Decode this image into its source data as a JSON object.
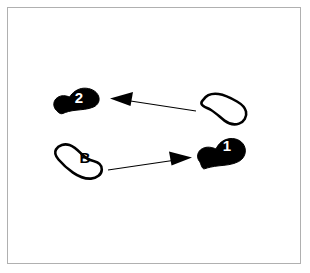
{
  "diagram": {
    "background_color": "#ffffff",
    "frame_color": "#b0b0b0",
    "ink_color": "#000000",
    "footprints": [
      {
        "id": "footprint-2",
        "label": "2",
        "fill": "filled",
        "fill_color": "#000000",
        "label_color": "#ffffff",
        "position": "upper-left",
        "orientation": "pointing-upper-right"
      },
      {
        "id": "footprint-start-right",
        "label": "",
        "fill": "outline",
        "fill_color": "#ffffff",
        "label_color": "#000000",
        "position": "upper-right",
        "orientation": "pointing-left"
      },
      {
        "id": "footprint-b",
        "label": "B",
        "fill": "outline",
        "fill_color": "#ffffff",
        "label_color": "#000000",
        "position": "lower-left",
        "orientation": "pointing-upper-left"
      },
      {
        "id": "footprint-1",
        "label": "1",
        "fill": "filled",
        "fill_color": "#000000",
        "label_color": "#ffffff",
        "position": "lower-right",
        "orientation": "pointing-upper-right"
      }
    ],
    "arrows": [
      {
        "id": "arrow-upper",
        "direction": "left",
        "from": "footprint-start-right",
        "to": "footprint-2",
        "color": "#000000"
      },
      {
        "id": "arrow-lower",
        "direction": "right",
        "from": "footprint-b",
        "to": "footprint-1",
        "color": "#000000"
      }
    ]
  }
}
